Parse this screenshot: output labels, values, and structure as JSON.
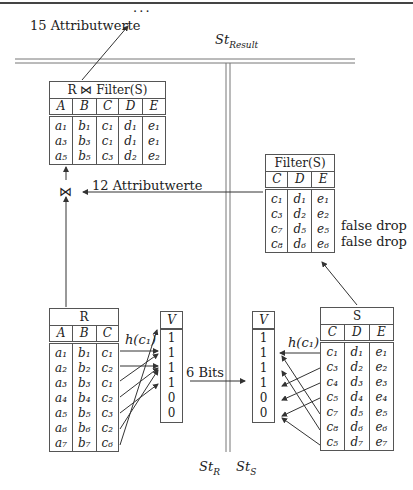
{
  "top_rule": true,
  "labels": {
    "result_attrs": "15 Attributwerte",
    "ellipsis": "· · ·",
    "st_result": "St",
    "st_result_sub": "Result",
    "filter_attrs": "12 Attributwerte",
    "bits": "6 Bits",
    "h_c1_left": "h(c₁)",
    "h_c1_right": "h(c₁)",
    "st_r": "St",
    "st_r_sub": "R",
    "st_s": "St",
    "st_s_sub": "S",
    "join_symbol": "⋈",
    "false_drop_1": "false drop",
    "false_drop_2": "false drop"
  },
  "result_table": {
    "title": "R ⋈ Filter(S)",
    "columns": [
      "A",
      "B",
      "C",
      "D",
      "E"
    ],
    "rows": [
      [
        "a₁",
        "b₁",
        "c₁",
        "d₁",
        "e₁"
      ],
      [
        "a₃",
        "b₃",
        "c₁",
        "d₁",
        "e₁"
      ],
      [
        "a₅",
        "b₅",
        "c₃",
        "d₂",
        "e₂"
      ]
    ]
  },
  "filter_table": {
    "title": "Filter(S)",
    "columns": [
      "C",
      "D",
      "E"
    ],
    "rows": [
      [
        "c₁",
        "d₁",
        "e₁"
      ],
      [
        "c₃",
        "d₂",
        "e₂"
      ],
      [
        "c₇",
        "d₅",
        "e₅"
      ],
      [
        "c₈",
        "d₆",
        "e₆"
      ]
    ]
  },
  "r_table": {
    "title": "R",
    "columns": [
      "A",
      "B",
      "C"
    ],
    "rows": [
      [
        "a₁",
        "b₁",
        "c₁"
      ],
      [
        "a₂",
        "b₂",
        "c₂"
      ],
      [
        "a₃",
        "b₃",
        "c₁"
      ],
      [
        "a₄",
        "b₄",
        "c₂"
      ],
      [
        "a₅",
        "b₅",
        "c₃"
      ],
      [
        "a₆",
        "b₆",
        "c₂"
      ],
      [
        "a₇",
        "b₇",
        "c₆"
      ]
    ]
  },
  "s_table": {
    "title": "S",
    "columns": [
      "C",
      "D",
      "E"
    ],
    "rows": [
      [
        "c₁",
        "d₁",
        "e₁"
      ],
      [
        "c₃",
        "d₂",
        "e₂"
      ],
      [
        "c₄",
        "d₃",
        "e₃"
      ],
      [
        "c₅",
        "d₄",
        "e₄"
      ],
      [
        "c₇",
        "d₅",
        "e₅"
      ],
      [
        "c₈",
        "d₆",
        "e₆"
      ],
      [
        "c₅",
        "d₇",
        "e₇"
      ]
    ]
  },
  "v_left": {
    "title": "V",
    "bits": [
      "1",
      "1",
      "1",
      "1",
      "0",
      "0"
    ]
  },
  "v_right": {
    "title": "V",
    "bits": [
      "1",
      "1",
      "1",
      "1",
      "0",
      "0"
    ]
  }
}
